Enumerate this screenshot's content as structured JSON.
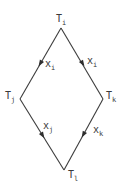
{
  "diagram": {
    "type": "lattice-diamond",
    "nodes": [
      {
        "id": "top",
        "base": "T",
        "sub": "i",
        "x": 61,
        "y": 28
      },
      {
        "id": "left",
        "base": "T",
        "sub": "j",
        "x": 20,
        "y": 99
      },
      {
        "id": "right",
        "base": "T",
        "sub": "k",
        "x": 103,
        "y": 99
      },
      {
        "id": "bottom",
        "base": "T",
        "sub": "l",
        "x": 64,
        "y": 170
      }
    ],
    "edges": [
      {
        "from": "top",
        "to": "left",
        "base": "x",
        "sub": "i"
      },
      {
        "from": "top",
        "to": "right",
        "base": "x",
        "sub": "i"
      },
      {
        "from": "left",
        "to": "bottom",
        "base": "x",
        "sub": "j"
      },
      {
        "from": "right",
        "to": "bottom",
        "base": "x",
        "sub": "k"
      }
    ]
  },
  "labels": {
    "node_top": {
      "base": "T",
      "sub": "i"
    },
    "node_left": {
      "base": "T",
      "sub": "j"
    },
    "node_right": {
      "base": "T",
      "sub": "k"
    },
    "node_bottom": {
      "base": "T",
      "sub": "l"
    },
    "edge_top_left": {
      "base": "x",
      "sub": "i"
    },
    "edge_top_right": {
      "base": "x",
      "sub": "i"
    },
    "edge_left_bottom": {
      "base": "x",
      "sub": "j"
    },
    "edge_right_bottom": {
      "base": "x",
      "sub": "k"
    }
  },
  "colors": {
    "line": "#3c3c3c",
    "text": "#3a3a3a",
    "background": "#ffffff"
  }
}
